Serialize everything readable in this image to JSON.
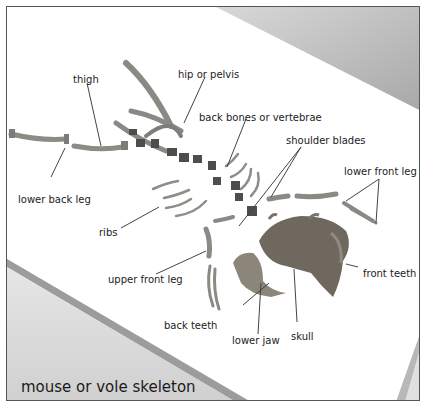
{
  "title": "mouse or vole skeleton",
  "labels": {
    "thigh": "thigh",
    "hip": "hip or pelvis",
    "back_bones": "back bones or vertebrae",
    "shoulder_blades": "shoulder blades",
    "lower_front_leg": "lower front leg",
    "lower_back_leg": "lower back leg",
    "ribs": "ribs",
    "upper_front_leg": "upper front leg",
    "front_teeth": "front teeth",
    "back_teeth": "back teeth",
    "lower_jaw": "lower jaw",
    "skull": "skull"
  },
  "colors": {
    "bone": "#8a8a84",
    "bone_dark": "#4a4c48",
    "board": "#ffffff",
    "shadow": "#9a9a9a",
    "line": "#444444"
  }
}
